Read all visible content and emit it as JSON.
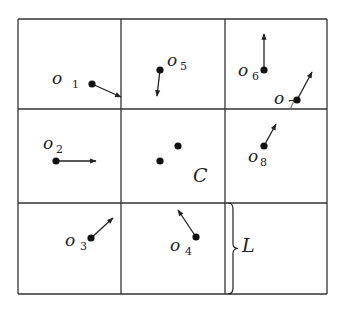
{
  "diagram": {
    "type": "grid-cells-with-objects",
    "grid": {
      "rows": 3,
      "cols": 3,
      "x_lines": [
        18,
        121,
        225,
        327
      ],
      "y_lines": [
        19,
        109,
        203,
        294
      ],
      "stroke": "#333333"
    },
    "objects": [
      {
        "id": "o1",
        "label": "o",
        "sub": "1",
        "dot": [
          92,
          84
        ],
        "tip": [
          121,
          97
        ],
        "label_pos": [
          52,
          84
        ],
        "sub_pos": [
          72,
          88
        ]
      },
      {
        "id": "o2",
        "label": "o",
        "sub": "2",
        "dot": [
          56,
          161
        ],
        "tip": [
          96,
          161
        ],
        "label_pos": [
          43,
          149
        ],
        "sub_pos": [
          56,
          153
        ]
      },
      {
        "id": "o3",
        "label": "o",
        "sub": "3",
        "dot": [
          91,
          238
        ],
        "tip": [
          113,
          218
        ],
        "label_pos": [
          65,
          246
        ],
        "sub_pos": [
          80,
          250
        ]
      },
      {
        "id": "o4",
        "label": "o",
        "sub": "4",
        "dot": [
          196,
          237
        ],
        "tip": [
          178,
          210
        ],
        "label_pos": [
          170,
          251
        ],
        "sub_pos": [
          185,
          255
        ]
      },
      {
        "id": "o5",
        "label": "o",
        "sub": "5",
        "dot": [
          160,
          70
        ],
        "tip": [
          157,
          96
        ],
        "label_pos": [
          167,
          66
        ],
        "sub_pos": [
          180,
          70
        ]
      },
      {
        "id": "o6",
        "label": "o",
        "sub": "6",
        "dot": [
          264,
          70
        ],
        "tip": [
          264,
          34
        ],
        "label_pos": [
          238,
          76
        ],
        "sub_pos": [
          252,
          80
        ]
      },
      {
        "id": "o7",
        "label": "o",
        "sub": "7",
        "dot": [
          297,
          100
        ],
        "tip": [
          312,
          72
        ],
        "label_pos": [
          274,
          104
        ],
        "sub_pos": [
          288,
          108
        ]
      },
      {
        "id": "o8",
        "label": "o",
        "sub": "8",
        "dot": [
          264,
          146
        ],
        "tip": [
          276,
          124
        ],
        "label_pos": [
          248,
          162
        ],
        "sub_pos": [
          260,
          166
        ]
      }
    ],
    "cluster_C": {
      "label": "C",
      "dots": [
        [
          160,
          161
        ],
        [
          178,
          146
        ]
      ],
      "label_pos": [
        193,
        182
      ]
    },
    "brace_L": {
      "label": "L",
      "x": 228,
      "y_top": 203,
      "y_bottom": 294,
      "label_pos": [
        242,
        252
      ]
    }
  }
}
